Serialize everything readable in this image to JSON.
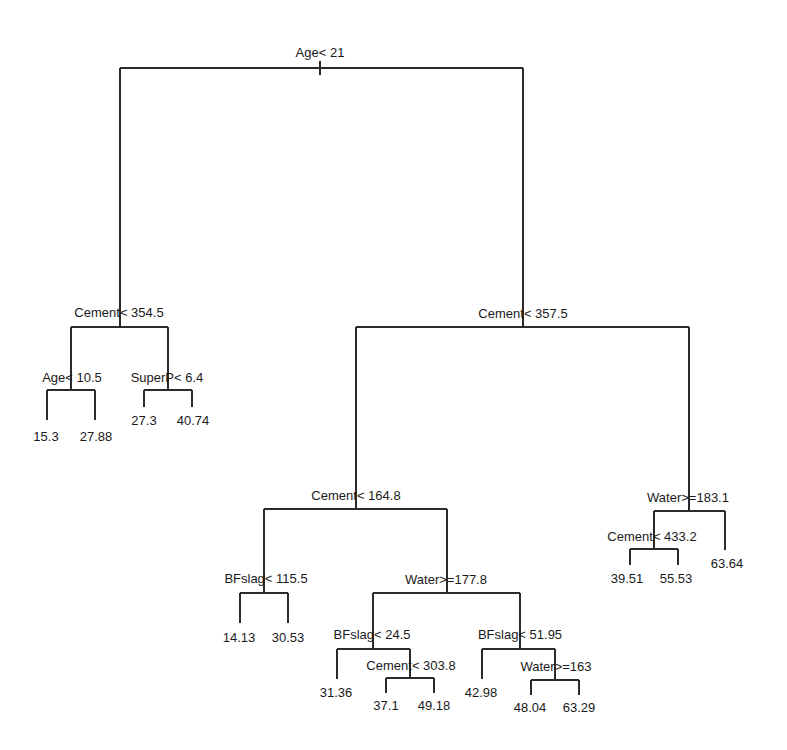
{
  "tree": {
    "title": "",
    "line_color": "#2a2a2a",
    "nodes": {
      "root": {
        "label": "Age< 21",
        "x": 320,
        "y": 52
      },
      "n_left": {
        "label": "Cement< 354.5",
        "x": 119,
        "y": 312
      },
      "n_right": {
        "label": "Cement< 357.5",
        "x": 523,
        "y": 313
      },
      "n_age105": {
        "label": "Age< 10.5",
        "x": 72,
        "y": 377
      },
      "n_superp": {
        "label": "SuperP< 6.4",
        "x": 167,
        "y": 377
      },
      "n_cem1648": {
        "label": "Cement< 164.8",
        "x": 356,
        "y": 495
      },
      "n_water1831": {
        "label": "Water>=183.1",
        "x": 688,
        "y": 497
      },
      "n_cem4332": {
        "label": "Cement< 433.2",
        "x": 652,
        "y": 536
      },
      "n_bfslag1155": {
        "label": "BFslag< 115.5",
        "x": 266,
        "y": 578
      },
      "n_water1778": {
        "label": "Water>=177.8",
        "x": 446,
        "y": 579
      },
      "n_bfslag245": {
        "label": "BFslag< 24.5",
        "x": 372,
        "y": 634
      },
      "n_bfslag5195": {
        "label": "BFslag< 51.95",
        "x": 520,
        "y": 634
      },
      "n_cem3038": {
        "label": "Cement< 303.8",
        "x": 411,
        "y": 665
      },
      "n_water163": {
        "label": "Water>=163",
        "x": 556,
        "y": 666
      }
    },
    "leaves": [
      {
        "value": "15.3",
        "x": 46,
        "y": 436
      },
      {
        "value": "27.88",
        "x": 96,
        "y": 436
      },
      {
        "value": "27.3",
        "x": 144,
        "y": 420
      },
      {
        "value": "40.74",
        "x": 193,
        "y": 420
      },
      {
        "value": "39.51",
        "x": 627,
        "y": 578
      },
      {
        "value": "55.53",
        "x": 676,
        "y": 578
      },
      {
        "value": "63.64",
        "x": 727,
        "y": 563
      },
      {
        "value": "14.13",
        "x": 239,
        "y": 637
      },
      {
        "value": "30.53",
        "x": 288,
        "y": 637
      },
      {
        "value": "31.36",
        "x": 336,
        "y": 692
      },
      {
        "value": "37.1",
        "x": 386,
        "y": 705
      },
      {
        "value": "49.18",
        "x": 434,
        "y": 705
      },
      {
        "value": "42.98",
        "x": 481,
        "y": 692
      },
      {
        "value": "48.04",
        "x": 530,
        "y": 707
      },
      {
        "value": "63.29",
        "x": 579,
        "y": 707
      }
    ]
  }
}
